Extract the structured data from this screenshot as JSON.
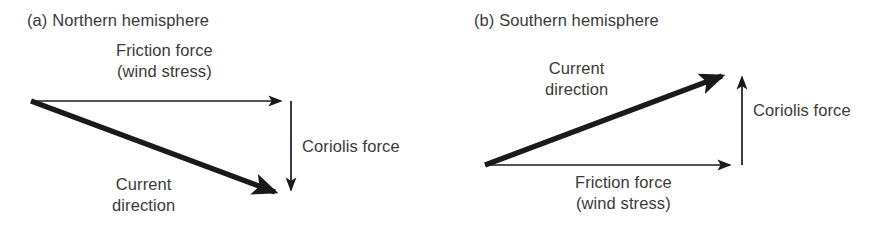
{
  "figure": {
    "background_color": "#ffffff",
    "ink_color": "#1a1a1a",
    "text_color": "#3a3a3a"
  },
  "panels": [
    {
      "id": "a",
      "title": "(a) Northern hemisphere",
      "labels": {
        "friction_line1": "Friction force",
        "friction_line2": "(wind stress)",
        "coriolis": "Coriolis force",
        "current_line1": "Current",
        "current_line2": "direction"
      },
      "vectors": {
        "friction": {
          "from": [
            31,
            101
          ],
          "to": [
            288,
            101
          ],
          "style": "thin",
          "label": "Friction force (wind stress)"
        },
        "coriolis": {
          "from": [
            291,
            101
          ],
          "to": [
            291,
            197
          ],
          "style": "thin",
          "label": "Coriolis force"
        },
        "current": {
          "from": [
            31,
            101
          ],
          "to": [
            290,
            197
          ],
          "style": "thick",
          "label": "Current direction"
        }
      }
    },
    {
      "id": "b",
      "title": "(b) Southern hemisphere",
      "labels": {
        "friction_line1": "Friction force",
        "friction_line2": "(wind stress)",
        "coriolis": "Coriolis force",
        "current_line1": "Current",
        "current_line2": "direction"
      },
      "vectors": {
        "friction": {
          "from": [
            40,
            165
          ],
          "to": [
            292,
            165
          ],
          "style": "thin",
          "label": "Friction force (wind stress)"
        },
        "coriolis": {
          "from": [
            297,
            165
          ],
          "to": [
            297,
            70
          ],
          "style": "thin",
          "label": "Coriolis force"
        },
        "current": {
          "from": [
            40,
            165
          ],
          "to": [
            292,
            70
          ],
          "style": "thick",
          "label": "Current direction"
        }
      }
    }
  ]
}
